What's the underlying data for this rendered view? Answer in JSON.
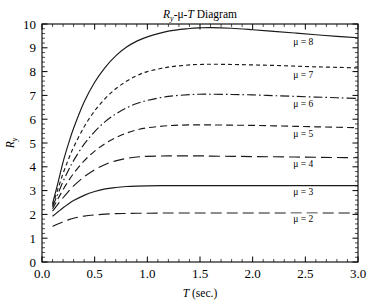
{
  "chart_data": {
    "type": "line",
    "title_plain": "Ry-μ-T Diagram",
    "xlabel": "T (sec.)",
    "ylabel": "R",
    "ylabel_sub": "y",
    "xlim": [
      0.0,
      3.0
    ],
    "ylim": [
      0,
      10
    ],
    "grid": false,
    "legend_position": "inline-right",
    "x_major_step": 0.5,
    "x_minor_step": 0.1,
    "y_major_step": 1,
    "y_minor_step": 0.2,
    "xticks": [
      "0.0",
      "0.5",
      "1.0",
      "1.5",
      "2.0",
      "2.5",
      "3.0"
    ],
    "xtick_values": [
      0.0,
      0.5,
      1.0,
      1.5,
      2.0,
      2.5,
      3.0
    ],
    "yticks": [
      "0",
      "1",
      "2",
      "3",
      "4",
      "5",
      "6",
      "7",
      "8",
      "9",
      "10"
    ],
    "ytick_values": [
      0,
      1,
      2,
      3,
      4,
      5,
      6,
      7,
      8,
      9,
      10
    ],
    "x": [
      0.1,
      0.15,
      0.2,
      0.25,
      0.3,
      0.4,
      0.5,
      0.6,
      0.7,
      0.8,
      0.9,
      1.0,
      1.2,
      1.4,
      1.5,
      1.6,
      1.8,
      2.0,
      2.2,
      2.4,
      2.6,
      2.8,
      3.0
    ],
    "series": [
      {
        "name": "μ = 8",
        "mu": 8,
        "style": "solid",
        "dasharray": "",
        "label": "μ = 8",
        "label_x": 2.48,
        "label_y": 9.12,
        "plateau": 9.85,
        "values": [
          2.45,
          3.3,
          4.2,
          4.95,
          5.62,
          6.72,
          7.55,
          8.18,
          8.66,
          9.02,
          9.28,
          9.46,
          9.7,
          9.81,
          9.84,
          9.85,
          9.82,
          9.76,
          9.69,
          9.62,
          9.55,
          9.48,
          9.42
        ]
      },
      {
        "name": "μ = 7",
        "mu": 7,
        "style": "short-dash",
        "dasharray": "4,3",
        "label": "μ = 7",
        "label_x": 2.48,
        "label_y": 7.72,
        "plateau": 8.3,
        "values": [
          2.38,
          3.05,
          3.72,
          4.3,
          4.82,
          5.68,
          6.35,
          6.87,
          7.28,
          7.59,
          7.83,
          8.0,
          8.19,
          8.28,
          8.3,
          8.31,
          8.3,
          8.28,
          8.26,
          8.23,
          8.2,
          8.18,
          8.15
        ]
      },
      {
        "name": "μ = 6",
        "mu": 6,
        "style": "dash-dot",
        "dasharray": "9,3,1.6,3",
        "label": "μ = 6",
        "label_x": 2.48,
        "label_y": 6.52,
        "plateau": 7.05,
        "values": [
          2.32,
          2.85,
          3.38,
          3.84,
          4.26,
          4.95,
          5.48,
          5.9,
          6.22,
          6.47,
          6.66,
          6.79,
          6.96,
          7.03,
          7.05,
          7.05,
          7.04,
          7.02,
          6.99,
          6.96,
          6.93,
          6.9,
          6.87
        ]
      },
      {
        "name": "μ = 5",
        "mu": 5,
        "style": "dash",
        "dasharray": "7,4",
        "label": "μ = 5",
        "label_x": 2.48,
        "label_y": 5.25,
        "plateau": 5.75,
        "values": [
          2.24,
          2.64,
          3.04,
          3.4,
          3.72,
          4.25,
          4.66,
          4.98,
          5.22,
          5.41,
          5.55,
          5.64,
          5.73,
          5.76,
          5.76,
          5.76,
          5.75,
          5.74,
          5.72,
          5.7,
          5.68,
          5.66,
          5.64
        ]
      },
      {
        "name": "μ = 4",
        "mu": 4,
        "style": "long-dash",
        "dasharray": "11,5",
        "label": "μ = 4",
        "label_x": 2.48,
        "label_y": 4.0,
        "plateau": 4.45,
        "values": [
          2.14,
          2.42,
          2.7,
          2.96,
          3.2,
          3.58,
          3.88,
          4.1,
          4.25,
          4.35,
          4.41,
          4.44,
          4.46,
          4.46,
          4.46,
          4.45,
          4.44,
          4.43,
          4.42,
          4.41,
          4.4,
          4.39,
          4.38
        ]
      },
      {
        "name": "μ = 3",
        "mu": 3,
        "style": "solid",
        "dasharray": "",
        "label": "μ = 3",
        "label_x": 2.48,
        "label_y": 2.82,
        "plateau": 3.2,
        "values": [
          1.92,
          2.1,
          2.28,
          2.44,
          2.58,
          2.8,
          2.96,
          3.07,
          3.13,
          3.17,
          3.19,
          3.2,
          3.21,
          3.21,
          3.21,
          3.21,
          3.21,
          3.21,
          3.21,
          3.21,
          3.21,
          3.21,
          3.21
        ]
      },
      {
        "name": "μ = 2",
        "mu": 2,
        "style": "long-dash",
        "dasharray": "11,5",
        "label": "μ = 2",
        "label_x": 2.48,
        "label_y": 1.7,
        "plateau": 2.05,
        "values": [
          1.5,
          1.6,
          1.69,
          1.77,
          1.84,
          1.93,
          1.98,
          2.01,
          2.03,
          2.04,
          2.05,
          2.05,
          2.06,
          2.06,
          2.06,
          2.06,
          2.06,
          2.06,
          2.06,
          2.06,
          2.06,
          2.06,
          2.06
        ]
      }
    ]
  },
  "colors": {
    "line": "#1a1a1a",
    "axis": "#000000",
    "background": "#ffffff",
    "text": "#000000"
  }
}
